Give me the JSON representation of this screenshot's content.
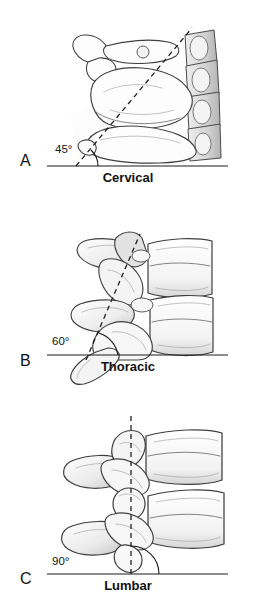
{
  "figure": {
    "background_color": "#ffffff",
    "line_color": "#1a1a1a",
    "bone_outline_color": "#3f3f3f",
    "bone_fill_color": "#fdfdfd",
    "shading_color": "#c9c9c9"
  },
  "panels": [
    {
      "letter": "A",
      "caption": "Cervical",
      "angle_label": "45°",
      "angle_degrees": 45,
      "reference_line": "horizontal-baseline",
      "facet_line_style": "dashed",
      "description": "Lateral view of cervical vertebrae with facet joint plane inclined 45 degrees to the horizontal"
    },
    {
      "letter": "B",
      "caption": "Thoracic",
      "angle_label": "60°",
      "angle_degrees": 60,
      "reference_line": "horizontal-baseline",
      "facet_line_style": "dashed",
      "description": "Lateral view of thoracic vertebrae with facet joint plane inclined 60 degrees to the horizontal"
    },
    {
      "letter": "C",
      "caption": "Lumbar",
      "angle_label": "90°",
      "angle_degrees": 90,
      "reference_line": "horizontal-baseline",
      "facet_line_style": "dashed",
      "description": "Lateral view of lumbar vertebrae with facet joint plane vertical, 90 degrees to the horizontal"
    }
  ]
}
